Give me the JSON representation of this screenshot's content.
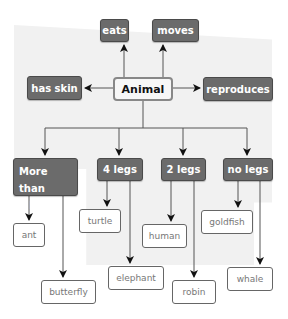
{
  "diagram": {
    "root": {
      "label": "Animal"
    },
    "properties": {
      "eats": "eats",
      "moves": "moves",
      "has_skin": "has skin",
      "reproduces": "reproduces"
    },
    "categories": [
      {
        "label": "More than 4 legs",
        "line1": "More than",
        "line2": "4 legs",
        "examples": [
          "ant",
          "butterfly"
        ]
      },
      {
        "label": "4 legs",
        "examples": [
          "turtle",
          "elephant"
        ]
      },
      {
        "label": "2 legs",
        "examples": [
          "human",
          "robin"
        ]
      },
      {
        "label": "no legs",
        "examples": [
          "goldfish",
          "whale"
        ]
      }
    ],
    "colors": {
      "dark_node": "#6b6b6b",
      "root_border": "#888888",
      "background_shape": "#f1f1f1",
      "line": "#555555"
    }
  }
}
